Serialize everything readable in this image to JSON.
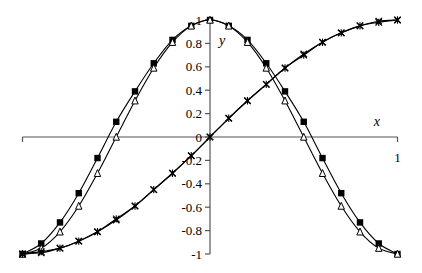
{
  "chart_data": {
    "type": "line",
    "title": "",
    "xlabel": "x",
    "ylabel": "y",
    "xlim": [
      -1,
      1
    ],
    "ylim": [
      -1,
      1
    ],
    "grid": false,
    "legend": "none",
    "x_tick_labels": [
      "1"
    ],
    "y_tick_labels": [
      "1",
      "0.8",
      "0.6",
      "0.4",
      "0.2",
      "0",
      "-0.2",
      "-0.4",
      "-0.6",
      "-0.8",
      "-1"
    ],
    "y_ticks": [
      1,
      0.8,
      0.6,
      0.4,
      0.2,
      0,
      -0.2,
      -0.4,
      -0.6,
      -0.8,
      -1
    ],
    "x": [
      -1,
      -0.9,
      -0.8,
      -0.7,
      -0.6,
      -0.5,
      -0.4,
      -0.3,
      -0.2,
      -0.1,
      0,
      0.1,
      0.2,
      0.3,
      0.4,
      0.5,
      0.6,
      0.7,
      0.8,
      0.9,
      1
    ],
    "series": [
      {
        "name": "cos approximation (square markers)",
        "marker": "square",
        "values": [
          -1,
          -0.91,
          -0.73,
          -0.48,
          -0.18,
          0.13,
          0.39,
          0.63,
          0.83,
          0.95,
          1,
          0.95,
          0.83,
          0.63,
          0.39,
          0.13,
          -0.18,
          -0.48,
          -0.73,
          -0.91,
          -1
        ]
      },
      {
        "name": "cos (triangle markers)",
        "marker": "triangle",
        "values": [
          -1,
          -0.95,
          -0.81,
          -0.59,
          -0.31,
          0,
          0.31,
          0.59,
          0.81,
          0.95,
          1,
          0.95,
          0.81,
          0.59,
          0.31,
          0,
          -0.31,
          -0.59,
          -0.81,
          -0.95,
          -1
        ]
      },
      {
        "name": "sin (x markers)",
        "marker": "x",
        "values": [
          -1,
          -0.99,
          -0.95,
          -0.89,
          -0.81,
          -0.71,
          -0.59,
          -0.45,
          -0.31,
          -0.16,
          0,
          0.16,
          0.31,
          0.45,
          0.59,
          0.71,
          0.81,
          0.89,
          0.95,
          0.99,
          1
        ]
      },
      {
        "name": "sin approximation (star markers)",
        "marker": "star",
        "values": [
          -1,
          -0.98,
          -0.95,
          -0.89,
          -0.81,
          -0.7,
          -0.59,
          -0.45,
          -0.31,
          -0.16,
          0,
          0.16,
          0.31,
          0.45,
          0.59,
          0.7,
          0.81,
          0.89,
          0.95,
          0.98,
          1
        ]
      }
    ]
  },
  "colors": {
    "line": "#000000",
    "axis": "#555555",
    "background": "#ffffff"
  }
}
